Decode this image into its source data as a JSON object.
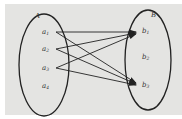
{
  "diagram": {
    "type": "mapping-diagram",
    "background_color": "#e4e4e2",
    "stroke_color": "#222222",
    "sets": [
      {
        "name": "A",
        "elements": [
          {
            "base": "a",
            "sub": "1"
          },
          {
            "base": "a",
            "sub": "2"
          },
          {
            "base": "a",
            "sub": "3"
          },
          {
            "base": "a",
            "sub": "4"
          }
        ]
      },
      {
        "name": "B",
        "elements": [
          {
            "base": "b",
            "sub": "1"
          },
          {
            "base": "b",
            "sub": "2"
          },
          {
            "base": "b",
            "sub": "3"
          }
        ]
      }
    ],
    "arrows": [
      {
        "from": "a1",
        "to": "b1"
      },
      {
        "from": "a1",
        "to": "b3"
      },
      {
        "from": "a2",
        "to": "b1"
      },
      {
        "from": "a2",
        "to": "b3"
      },
      {
        "from": "a3",
        "to": "b1"
      },
      {
        "from": "a3",
        "to": "b3"
      }
    ]
  }
}
